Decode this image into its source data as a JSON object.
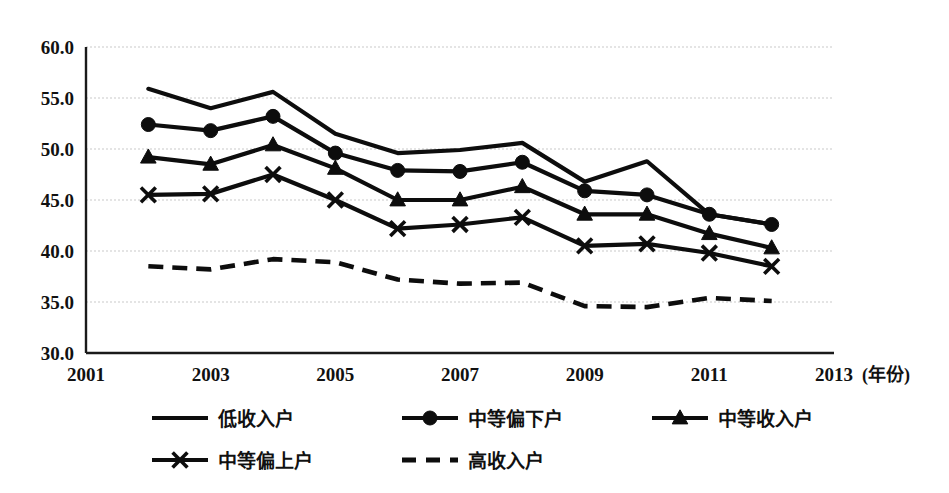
{
  "chart_data": {
    "type": "line",
    "title": "",
    "xlabel": "(年份)",
    "ylabel": "",
    "x": [
      2002,
      2003,
      2004,
      2005,
      2006,
      2007,
      2008,
      2009,
      2010,
      2011,
      2012
    ],
    "xlim": [
      2001,
      2013
    ],
    "ylim": [
      30.0,
      60.0
    ],
    "ytick_labels": [
      "60.0",
      "55.0",
      "50.0",
      "45.0",
      "40.0",
      "35.0",
      "30.0"
    ],
    "ytick_values": [
      60.0,
      55.0,
      50.0,
      45.0,
      40.0,
      35.0,
      30.0
    ],
    "xtick_labels": [
      "2001",
      "2003",
      "2005",
      "2007",
      "2009",
      "2011",
      "2013"
    ],
    "xtick_values": [
      2001,
      2003,
      2005,
      2007,
      2009,
      2011,
      2013
    ],
    "grid": true,
    "legend_position": "bottom",
    "series": [
      {
        "name": "低收入户",
        "marker": "none",
        "style": "solid",
        "values": [
          55.9,
          54.0,
          55.6,
          51.5,
          49.6,
          49.9,
          50.6,
          46.8,
          48.8,
          43.6,
          42.6
        ]
      },
      {
        "name": "中等偏下户",
        "marker": "circle",
        "style": "solid",
        "values": [
          52.4,
          51.8,
          53.2,
          49.6,
          47.9,
          47.8,
          48.7,
          45.9,
          45.5,
          43.6,
          42.6
        ]
      },
      {
        "name": "中等收入户",
        "marker": "triangle",
        "style": "solid",
        "values": [
          49.2,
          48.5,
          50.4,
          48.1,
          45.0,
          45.0,
          46.3,
          43.6,
          43.6,
          41.7,
          40.3
        ]
      },
      {
        "name": "中等偏上户",
        "marker": "cross",
        "style": "solid",
        "values": [
          45.5,
          45.6,
          47.5,
          45.0,
          42.2,
          42.6,
          43.3,
          40.5,
          40.7,
          39.8,
          38.5
        ]
      },
      {
        "name": "高收入户",
        "marker": "none",
        "style": "dashed",
        "values": [
          38.5,
          38.2,
          39.2,
          38.9,
          37.2,
          36.8,
          36.9,
          34.6,
          34.5,
          35.4,
          35.1
        ]
      }
    ]
  },
  "legend": {
    "items": [
      {
        "label": "低收入户",
        "marker": "none",
        "style": "solid"
      },
      {
        "label": "中等偏下户",
        "marker": "circle",
        "style": "solid"
      },
      {
        "label": "中等收入户",
        "marker": "triangle",
        "style": "solid"
      },
      {
        "label": "中等偏上户",
        "marker": "cross",
        "style": "solid"
      },
      {
        "label": "高收入户",
        "marker": "none",
        "style": "dashed"
      }
    ]
  },
  "colors": {
    "series": "#0d0d0d",
    "grid": "#c9c9c9",
    "axis": "#1a1a1a",
    "background": "#ffffff",
    "text": "#111111"
  }
}
